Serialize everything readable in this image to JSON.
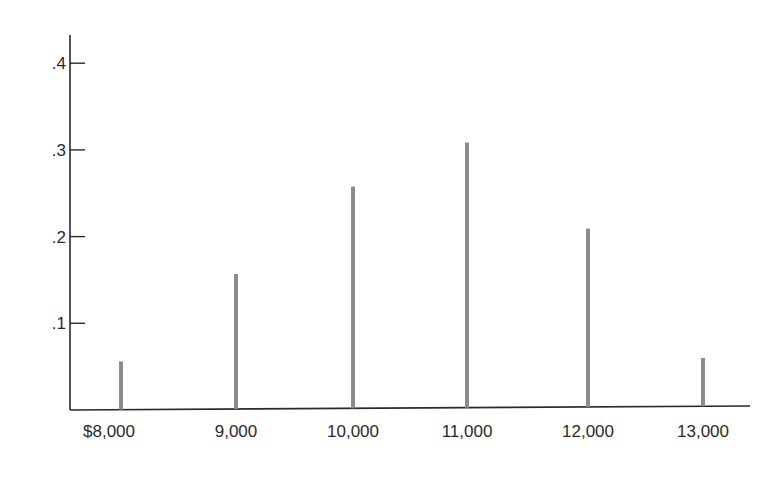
{
  "chart_data": {
    "type": "bar",
    "style": "spike",
    "title": "",
    "xlabel": "",
    "ylabel": "",
    "categories": [
      "$8,000",
      "9,000",
      "10,000",
      "11,000",
      "12,000",
      "13,000"
    ],
    "x": [
      8000,
      9000,
      10000,
      11000,
      12000,
      13000
    ],
    "values": [
      0.05,
      0.15,
      0.25,
      0.3,
      0.2,
      0.05
    ],
    "ylim": [
      0,
      0.42
    ],
    "yticks": [
      0.1,
      0.2,
      0.3,
      0.4
    ],
    "ytick_labels": [
      ".1",
      ".2",
      ".3",
      ".4"
    ],
    "grid": false,
    "legend": null,
    "bar_color": "#8c8c8c",
    "axis_color": "#2a2a2a"
  }
}
